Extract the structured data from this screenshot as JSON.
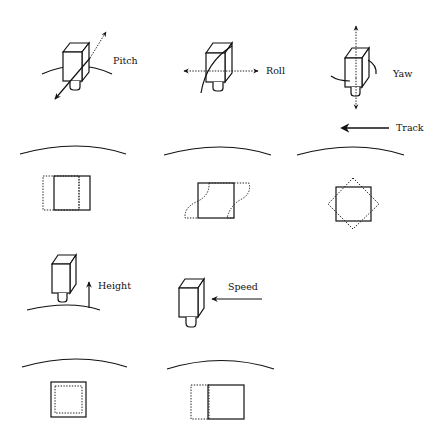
{
  "figure": {
    "panels": [
      {
        "id": "pitch",
        "label": "Pitch",
        "motion": "rotation about lateral axis",
        "footprint_effect": "footprint shifts along-track (dotted rectangle offset left)"
      },
      {
        "id": "roll",
        "label": "Roll",
        "motion": "rotation about flight axis",
        "footprint_effect": "footprint skewed (dotted S-shaped distortion)"
      },
      {
        "id": "yaw",
        "label": "Yaw",
        "motion": "rotation about vertical axis",
        "footprint_effect": "footprint rotated (dotted diamond over solid square)"
      },
      {
        "id": "height",
        "label": "Height",
        "motion": "altitude change",
        "footprint_effect": "footprint scale change (dotted inner square)"
      },
      {
        "id": "speed",
        "label": "Speed",
        "motion": "velocity change",
        "footprint_effect": "footprint elongated along-track (dotted extension left)"
      }
    ],
    "track": {
      "label": "Track",
      "direction": "left"
    },
    "colors": {
      "line": "#111111",
      "background": "#ffffff"
    }
  }
}
